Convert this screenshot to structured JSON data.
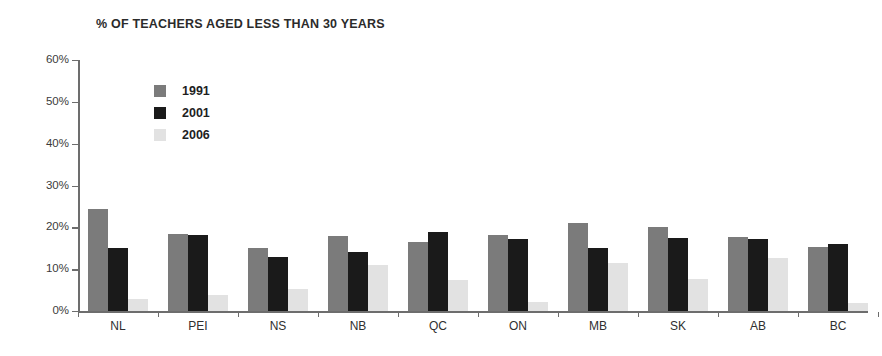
{
  "chart_data": {
    "type": "bar",
    "title": "% OF TEACHERS AGED LESS THAN 30 YEARS",
    "xlabel": "",
    "ylabel": "",
    "ylim": [
      0,
      60
    ],
    "ytick_labels": [
      "60%",
      "50%",
      "40%",
      "30%",
      "20%",
      "10%",
      "0%"
    ],
    "ytick_values": [
      60,
      50,
      40,
      30,
      20,
      10,
      0
    ],
    "grid": false,
    "legend_position": "upper-left-inside",
    "categories": [
      "NL",
      "PEI",
      "NS",
      "NB",
      "QC",
      "ON",
      "MB",
      "SK",
      "AB",
      "BC"
    ],
    "series": [
      {
        "name": "1991",
        "color": "#7b7b7b",
        "values": [
          24.5,
          18.5,
          15.0,
          18.0,
          16.5,
          18.2,
          21.1,
          20.0,
          17.6,
          15.4
        ]
      },
      {
        "name": "2001",
        "color": "#1a1a1a",
        "values": [
          15.0,
          18.2,
          12.9,
          14.1,
          19.0,
          17.3,
          15.1,
          17.5,
          17.2,
          16.0
        ]
      },
      {
        "name": "2006",
        "color": "#e2e2e2",
        "values": [
          2.8,
          3.9,
          5.3,
          11.0,
          7.3,
          2.1,
          11.5,
          7.6,
          12.6,
          2.0
        ]
      }
    ]
  }
}
